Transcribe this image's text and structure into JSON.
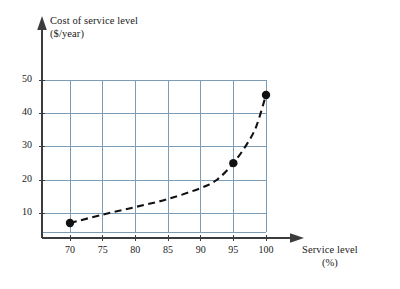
{
  "chart_data": {
    "type": "line",
    "title": "",
    "xlabel": "Service level",
    "xunit": "(%)",
    "ylabel": "Cost of service level",
    "yunit": "($/year)",
    "xlim": [
      67.5,
      101.5
    ],
    "ylim": [
      0,
      57
    ],
    "xticks": [
      70,
      75,
      80,
      85,
      90,
      95,
      100
    ],
    "yticks": [
      10,
      20,
      30,
      40,
      50
    ],
    "grid": true,
    "legend": "none",
    "series": [
      {
        "name": "Cost of service level",
        "style": "dashed",
        "color": "#111111",
        "x": [
          70,
          75,
          80,
          85,
          90,
          92.5,
          95,
          97,
          98.5,
          100
        ],
        "y": [
          7,
          9.5,
          11.8,
          14.2,
          17.5,
          20,
          25,
          30.5,
          36,
          45.5
        ]
      }
    ],
    "markers": [
      {
        "x": 70,
        "y": 7
      },
      {
        "x": 95,
        "y": 25
      },
      {
        "x": 100,
        "y": 45.5
      }
    ],
    "colors": {
      "grid": "#7d9cb5",
      "axis": "#3c3c3c",
      "curve": "#111111",
      "marker": "#111111",
      "background": "#ffffff"
    }
  },
  "axes": {
    "y_title_main": "Cost of service level",
    "y_title_unit": "($/year)",
    "x_title_main": "Service level",
    "x_title_unit": "(%)"
  },
  "ticks": {
    "y": [
      "10",
      "20",
      "30",
      "40",
      "50"
    ],
    "x": [
      "70",
      "75",
      "80",
      "85",
      "90",
      "95",
      "100"
    ]
  }
}
